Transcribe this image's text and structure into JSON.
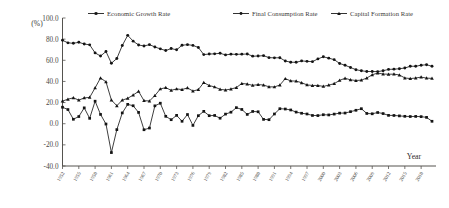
{
  "chart_data": {
    "type": "line",
    "title": "",
    "xlabel": "Year",
    "ylabel": "(%)",
    "ylim": [
      -40.0,
      100.0
    ],
    "ytick_labels": [
      "100.0",
      "80.0",
      "60.0",
      "40.0",
      "20.0",
      "0.0",
      "-20.0",
      "-40.0"
    ],
    "ytick_values": [
      100.0,
      80.0,
      60.0,
      40.0,
      20.0,
      0.0,
      -20.0,
      -40.0
    ],
    "grid": false,
    "legend_position": "top",
    "x_tick_step": 3,
    "categories": [
      "1952",
      "1953",
      "1954",
      "1955",
      "1956",
      "1957",
      "1958",
      "1959",
      "1960",
      "1961",
      "1962",
      "1963",
      "1964",
      "1965",
      "1966",
      "1967",
      "1968",
      "1969",
      "1970",
      "1971",
      "1972",
      "1973",
      "1974",
      "1975",
      "1976",
      "1977",
      "1978",
      "1979",
      "1980",
      "1981",
      "1982",
      "1983",
      "1984",
      "1985",
      "1986",
      "1987",
      "1988",
      "1989",
      "1990",
      "1991",
      "1992",
      "1993",
      "1994",
      "1995",
      "1996",
      "1997",
      "1998",
      "1999",
      "2000",
      "2001",
      "2002",
      "2003",
      "2004",
      "2005",
      "2006",
      "2007",
      "2008",
      "2009",
      "2010",
      "2011",
      "2012",
      "2013",
      "2014",
      "2015",
      "2016",
      "2017",
      "2018",
      "2019",
      "2020"
    ],
    "xtick_labels": [
      "1952",
      "1955",
      "1958",
      "1961",
      "1964",
      "1967",
      "1970",
      "1973",
      "1976",
      "1979",
      "1982",
      "1985",
      "1988",
      "1991",
      "1994",
      "1997",
      "2000",
      "2003",
      "2006",
      "2009",
      "2012",
      "2015",
      "2018"
    ],
    "series": [
      {
        "name": "Economic Growth Rate",
        "marker": "square",
        "values": [
          15.6,
          13.4,
          4.2,
          6.8,
          15.0,
          5.1,
          21.3,
          8.8,
          -0.3,
          -27.3,
          -5.6,
          10.2,
          18.3,
          17.0,
          10.7,
          -5.7,
          -4.1,
          16.9,
          19.4,
          7.0,
          3.8,
          7.9,
          2.3,
          8.7,
          -1.6,
          7.6,
          11.7,
          7.6,
          7.8,
          5.2,
          9.1,
          10.9,
          15.2,
          13.5,
          8.8,
          11.6,
          11.3,
          4.1,
          3.8,
          9.2,
          14.2,
          13.9,
          13.0,
          11.0,
          9.9,
          9.2,
          7.8,
          7.7,
          8.5,
          8.3,
          9.1,
          10.0,
          10.1,
          11.4,
          12.7,
          14.2,
          9.7,
          9.4,
          10.6,
          9.6,
          7.9,
          7.8,
          7.4,
          7.0,
          6.8,
          6.9,
          6.7,
          6.0,
          2.3
        ]
      },
      {
        "name": "Final Consumption Rate",
        "marker": "circle",
        "values": [
          78.9,
          76.5,
          76.1,
          77.0,
          75.4,
          74.6,
          67.0,
          64.0,
          68.3,
          57.2,
          61.7,
          74.0,
          83.6,
          78.1,
          74.5,
          73.5,
          74.8,
          72.6,
          70.8,
          69.2,
          71.1,
          69.9,
          74.2,
          74.8,
          74.1,
          72.1,
          65.4,
          65.9,
          66.1,
          66.6,
          65.1,
          65.8,
          65.6,
          65.8,
          65.9,
          63.9,
          64.0,
          64.4,
          62.5,
          62.3,
          62.4,
          59.3,
          58.2,
          58.1,
          59.4,
          59.0,
          58.7,
          61.3,
          63.3,
          62.0,
          60.6,
          57.0,
          55.3,
          53.2,
          51.1,
          50.1,
          49.4,
          49.4,
          49.3,
          50.1,
          51.4,
          51.6,
          52.0,
          52.7,
          54.3,
          54.4,
          55.3,
          55.8,
          54.3
        ]
      },
      {
        "name": "Capital Formation Rate",
        "marker": "triangle",
        "values": [
          21.4,
          23.2,
          24.5,
          22.3,
          24.4,
          24.9,
          33.9,
          43.3,
          39.6,
          22.4,
          17.0,
          22.3,
          24.0,
          27.1,
          30.6,
          21.8,
          21.5,
          26.6,
          32.9,
          34.1,
          31.6,
          32.9,
          32.3,
          33.9,
          30.9,
          32.3,
          38.9,
          36.1,
          34.8,
          32.5,
          31.9,
          32.8,
          34.2,
          38.1,
          37.5,
          36.3,
          37.0,
          36.6,
          34.9,
          34.8,
          36.6,
          42.6,
          40.5,
          40.3,
          38.8,
          36.7,
          36.2,
          36.2,
          35.3,
          36.5,
          37.9,
          41.0,
          43.0,
          41.5,
          40.9,
          41.2,
          43.2,
          46.3,
          47.9,
          47.0,
          46.8,
          46.9,
          46.1,
          43.3,
          42.7,
          43.2,
          44.1,
          43.1,
          42.9
        ]
      }
    ]
  },
  "legend": {
    "items": [
      {
        "label": "Economic Growth Rate"
      },
      {
        "label": "Final Consumption Rate"
      },
      {
        "label": "Capital Formation Rate"
      }
    ]
  }
}
